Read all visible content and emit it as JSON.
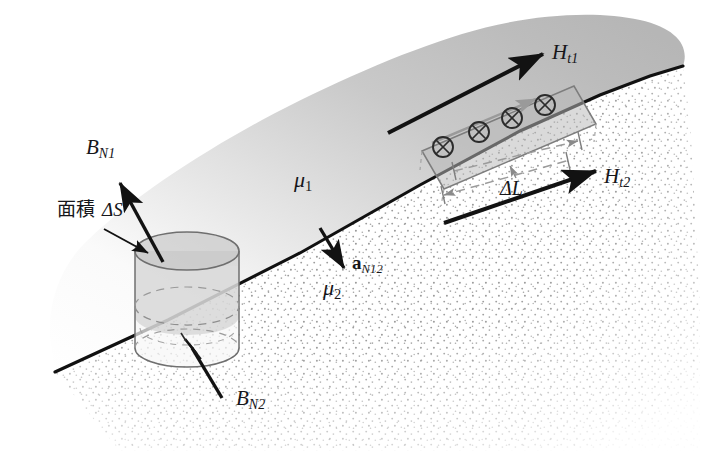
{
  "figure": {
    "domain": "diagram",
    "topic": "magnetic-field-boundary-conditions",
    "width": 727,
    "height": 451,
    "background": "#ffffff"
  },
  "media": {
    "upper": {
      "permeability_label": "μ",
      "permeability_sub": "1",
      "fill_light": "#fdfdfd",
      "fill_dark": "#b4b4b4"
    },
    "lower": {
      "permeability_label": "μ",
      "permeability_sub": "2",
      "stipple_color": "#8d8d8d",
      "fill": "#ffffff"
    },
    "interface_color": "#111111"
  },
  "labels": {
    "b_normal_1": {
      "base": "B",
      "sub": "N1"
    },
    "b_normal_2": {
      "base": "B",
      "sub": "N2"
    },
    "h_tangential_1": {
      "base": "H",
      "sub": "t1"
    },
    "h_tangential_2": {
      "base": "H",
      "sub": "t2"
    },
    "unit_normal": {
      "base": "a",
      "sub": "N12"
    },
    "mu_1": {
      "base": "μ",
      "sub": "1"
    },
    "mu_2": {
      "base": "μ",
      "sub": "2"
    },
    "area": {
      "text": "面積",
      "symbol": "ΔS"
    },
    "delta_length": {
      "symbol": "ΔL"
    }
  },
  "pillbox": {
    "name": "gaussian-pillbox-cylinder",
    "stroke": "#6f6f6f",
    "hidden_stroke": "#8f8f8f",
    "top_face_fill": "#c3c3c3",
    "body_fill_upper": "#c8c8c8",
    "body_fill_lower": "#f4f4f4"
  },
  "amperian_loop": {
    "name": "amperian-rectangular-loop",
    "stroke": "#7d7d7d",
    "fill": "#b8b8b8",
    "direction_arrow_color": "#9a9a9a",
    "current_symbol": "⊕",
    "current_count": 4,
    "current_symbol_color": "#2b2b2b"
  },
  "dimension": {
    "name": "delta-L-dimension",
    "dash_color": "#9b9b9b",
    "tick_color": "#6e6e6e"
  },
  "vectors": {
    "arrow_color": "#121212"
  }
}
